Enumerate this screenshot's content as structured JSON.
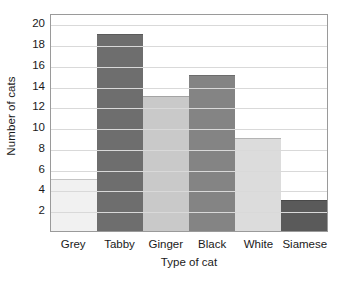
{
  "chart_data": {
    "type": "bar",
    "title": "",
    "subtitle": "",
    "xlabel": "Type of cat",
    "ylabel": "Number of cats",
    "categories": [
      "Grey",
      "Tabby",
      "Ginger",
      "Black",
      "White",
      "Siamese"
    ],
    "values": [
      5,
      19,
      13,
      15,
      9,
      3
    ],
    "series": [
      {
        "name": "Number of cats",
        "values": [
          5,
          19,
          13,
          15,
          9,
          3
        ]
      }
    ],
    "bar_colors": [
      "#f1f1f1",
      "#6e6e6e",
      "#c9c9c9",
      "#848484",
      "#dcdcdc",
      "#5a5a5a"
    ],
    "ylim": [
      0,
      21
    ],
    "xlim": [
      0,
      6
    ],
    "y_tick_labels": [
      "2",
      "4",
      "6",
      "8",
      "10",
      "12",
      "14",
      "16",
      "18",
      "20"
    ],
    "y_tick_values": [
      2,
      4,
      6,
      8,
      10,
      12,
      14,
      16,
      18,
      20
    ],
    "y_tick_step": 2,
    "grid": "horizontal",
    "gridline_color": "#d9d9d9",
    "legend": "none",
    "legend_position": "none",
    "bar_gap": 0,
    "frame_color": "#9a9a9a",
    "background_color": "#ffffff",
    "annotations": []
  }
}
